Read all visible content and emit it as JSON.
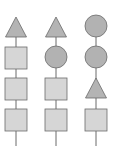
{
  "diagram": {
    "title": "",
    "colors": {
      "square_fill": "#d6d6d6",
      "round_fill": "#b2b2b2",
      "triangle_fill": "#b4b4b4",
      "stroke": "#6b6b6b",
      "line": "#6b6b6b"
    },
    "columns": [
      {
        "id": "column-1",
        "cx": 16,
        "shapes": [
          "triangle",
          "square",
          "square",
          "square"
        ]
      },
      {
        "id": "column-2",
        "cx": 56,
        "shapes": [
          "triangle",
          "circle",
          "square",
          "square"
        ]
      },
      {
        "id": "column-3",
        "cx": 96,
        "shapes": [
          "circle",
          "circle",
          "triangle",
          "square"
        ]
      }
    ]
  }
}
